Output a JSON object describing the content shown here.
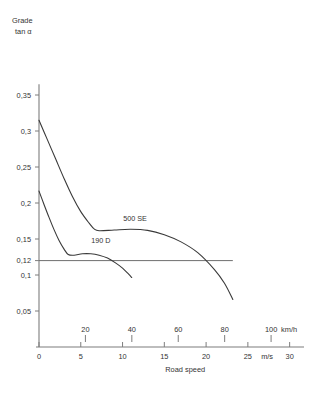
{
  "chart_data": {
    "type": "line",
    "title": "",
    "ylabel": "Grade\ntan α",
    "ylabel_line1": "Grade",
    "ylabel_line2": "tan α",
    "xlabel": "Road speed",
    "x_unit_primary": "m/s",
    "x_unit_secondary": "km/h",
    "xlim_ms": [
      0,
      31
    ],
    "ylim": [
      0,
      0.37
    ],
    "grid": false,
    "legend": "inline-annotations",
    "y_ticks": [
      {
        "value": 0.05,
        "label": "0,05"
      },
      {
        "value": 0.1,
        "label": "0,1"
      },
      {
        "value": 0.12,
        "label": "0,12"
      },
      {
        "value": 0.15,
        "label": "0,15"
      },
      {
        "value": 0.2,
        "label": "0,2"
      },
      {
        "value": 0.25,
        "label": "0,25"
      },
      {
        "value": 0.3,
        "label": "0,3"
      },
      {
        "value": 0.35,
        "label": "0,35"
      }
    ],
    "x_ticks_ms": [
      {
        "value": 0,
        "label": "0"
      },
      {
        "value": 5,
        "label": "5"
      },
      {
        "value": 10,
        "label": "10"
      },
      {
        "value": 15,
        "label": "15"
      },
      {
        "value": 20,
        "label": "20"
      },
      {
        "value": 25,
        "label": "25"
      },
      {
        "value": 30,
        "label": "30"
      }
    ],
    "x_ticks_kmh": [
      {
        "value": 20,
        "label": "20"
      },
      {
        "value": 40,
        "label": "40"
      },
      {
        "value": 60,
        "label": "60"
      },
      {
        "value": 80,
        "label": "80"
      },
      {
        "value": 100,
        "label": "100"
      }
    ],
    "reference_line": {
      "name": "0,12 reference",
      "y": 0.12,
      "x_start": 0,
      "x_end": 23.2
    },
    "series": [
      {
        "name": "500 SE",
        "label": "500 SE",
        "label_at": {
          "x_ms": 11.5,
          "y": 0.175
        },
        "points": [
          {
            "x": 0.0,
            "y": 0.315
          },
          {
            "x": 1.0,
            "y": 0.288
          },
          {
            "x": 2.0,
            "y": 0.261
          },
          {
            "x": 3.0,
            "y": 0.234
          },
          {
            "x": 4.0,
            "y": 0.209
          },
          {
            "x": 5.0,
            "y": 0.188
          },
          {
            "x": 6.0,
            "y": 0.172
          },
          {
            "x": 6.6,
            "y": 0.164
          },
          {
            "x": 7.2,
            "y": 0.1615
          },
          {
            "x": 9.0,
            "y": 0.1625
          },
          {
            "x": 11.0,
            "y": 0.1635
          },
          {
            "x": 13.0,
            "y": 0.162
          },
          {
            "x": 15.0,
            "y": 0.156
          },
          {
            "x": 17.0,
            "y": 0.146
          },
          {
            "x": 19.0,
            "y": 0.131
          },
          {
            "x": 21.0,
            "y": 0.1075
          },
          {
            "x": 22.2,
            "y": 0.0885
          },
          {
            "x": 23.2,
            "y": 0.066
          }
        ]
      },
      {
        "name": "190 D",
        "label": "190 D",
        "label_at": {
          "x_ms": 7.4,
          "y": 0.145
        },
        "points": [
          {
            "x": 0.0,
            "y": 0.2165
          },
          {
            "x": 0.6,
            "y": 0.198
          },
          {
            "x": 1.2,
            "y": 0.18
          },
          {
            "x": 1.8,
            "y": 0.163
          },
          {
            "x": 2.4,
            "y": 0.148
          },
          {
            "x": 3.0,
            "y": 0.136
          },
          {
            "x": 3.5,
            "y": 0.1285
          },
          {
            "x": 4.2,
            "y": 0.1275
          },
          {
            "x": 5.2,
            "y": 0.1295
          },
          {
            "x": 6.2,
            "y": 0.1295
          },
          {
            "x": 7.2,
            "y": 0.1275
          },
          {
            "x": 8.2,
            "y": 0.1235
          },
          {
            "x": 9.2,
            "y": 0.1165
          },
          {
            "x": 10.0,
            "y": 0.1095
          },
          {
            "x": 10.7,
            "y": 0.1015
          },
          {
            "x": 11.1,
            "y": 0.0965
          }
        ]
      }
    ]
  }
}
